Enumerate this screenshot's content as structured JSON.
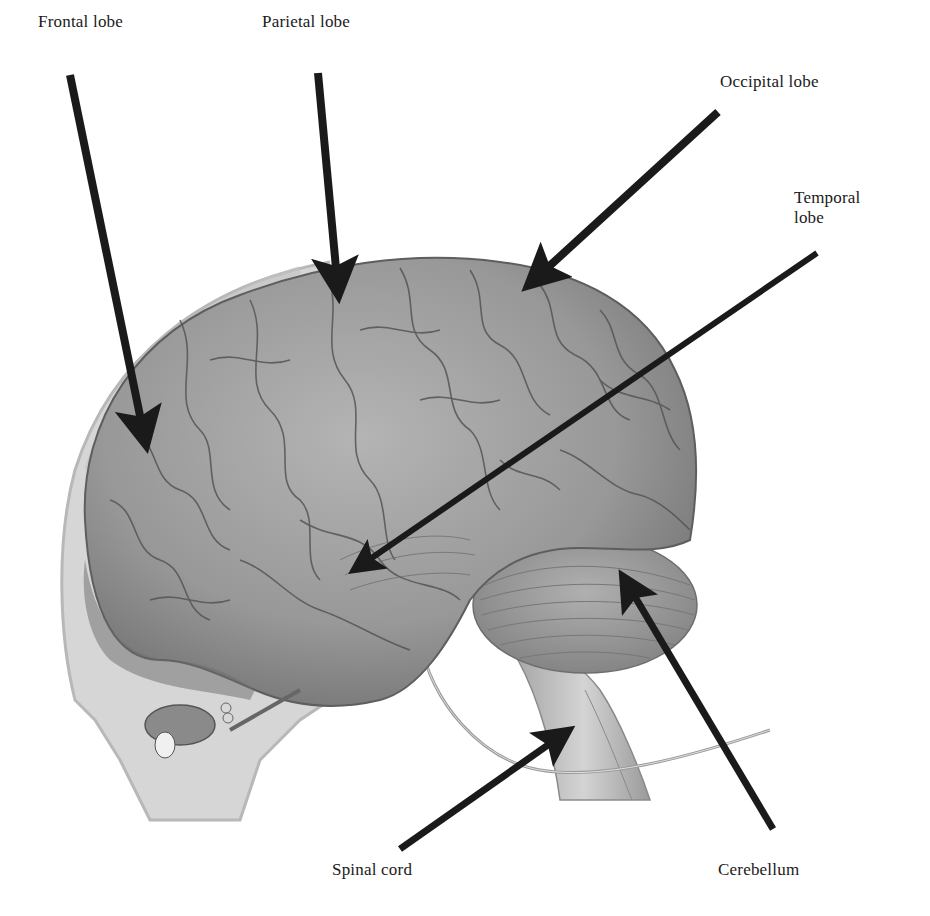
{
  "diagram": {
    "style": "grayscale illustration with black annotation arrows",
    "background_color": "#ffffff",
    "arrow_color": "#1a1a1a",
    "brain_color": "#9a9a9a"
  },
  "labels": [
    {
      "id": "frontal",
      "text": "Frontal lobe",
      "x": 38,
      "y": 38
    },
    {
      "id": "parietal",
      "text": "Parietal lobe",
      "x": 262,
      "y": 38
    },
    {
      "id": "occipital",
      "text": "Occipital lobe",
      "x": 720,
      "y": 72
    },
    {
      "id": "temporal",
      "text": "Temporal\nlobe",
      "x": 794,
      "y": 188
    },
    {
      "id": "spinal",
      "text": "Spinal cord",
      "x": 332,
      "y": 860
    },
    {
      "id": "cerebellum",
      "text": "Cerebellum",
      "x": 663,
      "y": 860
    }
  ],
  "arrows": [
    {
      "id": "frontal-arrow",
      "from": [
        70,
        75
      ],
      "to": [
        145,
        440
      ]
    },
    {
      "id": "parietal-arrow",
      "from": [
        318,
        73
      ],
      "to": [
        338,
        290
      ]
    },
    {
      "id": "occipital-arrow",
      "from": [
        718,
        112
      ],
      "to": [
        532,
        282
      ]
    },
    {
      "id": "temporal-arrow",
      "from": [
        817,
        253
      ],
      "to": [
        357,
        568
      ]
    },
    {
      "id": "spinal-arrow",
      "from": [
        400,
        849
      ],
      "to": [
        565,
        733
      ]
    },
    {
      "id": "cerebellum-arrow",
      "from": [
        773,
        829
      ],
      "to": [
        625,
        580
      ]
    }
  ]
}
